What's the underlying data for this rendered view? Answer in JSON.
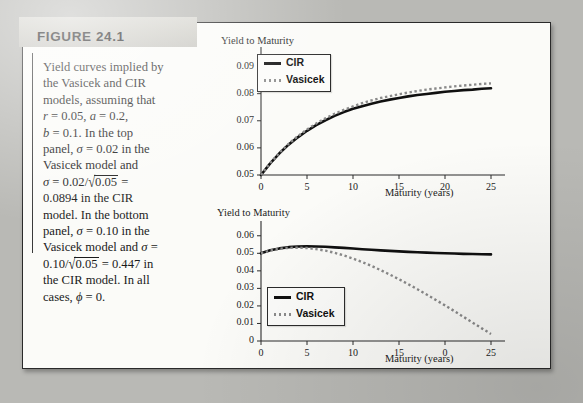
{
  "figure": {
    "label": "FIGURE 24.1",
    "caption_lines": [
      "Yield curves implied by",
      "the Vasicek and CIR",
      "models, assuming that",
      "r = 0.05, a = 0.2,",
      "b = 0.1. In the top",
      "panel, σ = 0.02 in the",
      "Vasicek model and",
      "σ = 0.02/√0.05 =",
      "0.0894 in the CIR",
      "model. In the bottom",
      "panel, σ = 0.10 in the",
      "Vasicek model and σ =",
      "0.10/√0.05 = 0.447 in",
      "the CIR model. In all",
      "cases, ϕ = 0."
    ],
    "parameters": {
      "r": "0.05",
      "a": "0.2",
      "b": "0.1",
      "phi": "0",
      "top_panel_sigma_vasicek": "0.02",
      "top_panel_sigma_cir": "0.0894",
      "bottom_panel_sigma_vasicek": "0.10",
      "bottom_panel_sigma_cir": "0.447"
    },
    "colors": {
      "cir_line": "#101010",
      "vasicek_line": "#8b8b8b",
      "header_band": "#d4d3cd",
      "paper": "#fbfbf8",
      "page_background": "#b9b9b5"
    }
  },
  "chart_data": [
    {
      "id": "top",
      "type": "line",
      "title": "",
      "ylabel": "Yield to Maturity",
      "xlabel": "Maturity (years)",
      "xlim": [
        0,
        25
      ],
      "ylim": [
        0.05,
        0.095
      ],
      "xticks": [
        0,
        5,
        10,
        15,
        20,
        25
      ],
      "xtick_labels": [
        "0",
        "5",
        "10",
        "15",
        "20",
        "25"
      ],
      "yticks": [
        0.05,
        0.06,
        0.07,
        0.08,
        0.09
      ],
      "ytick_labels": [
        "0.05",
        "0.06",
        "0.07",
        "0.08",
        "0.09"
      ],
      "grid": false,
      "legend_position": "upper left",
      "x": [
        0,
        1,
        2,
        3,
        4,
        5,
        6,
        7,
        8,
        9,
        10,
        11,
        12,
        13,
        14,
        15,
        16,
        17,
        18,
        19,
        20,
        21,
        22,
        23,
        24,
        25
      ],
      "series": [
        {
          "name": "CIR",
          "style": "solid",
          "values": [
            0.05,
            0.0543,
            0.058,
            0.0612,
            0.0639,
            0.0663,
            0.0684,
            0.0702,
            0.0718,
            0.0732,
            0.0744,
            0.0754,
            0.0763,
            0.0771,
            0.0778,
            0.0784,
            0.079,
            0.0795,
            0.0799,
            0.0803,
            0.0807,
            0.081,
            0.0813,
            0.0815,
            0.0818,
            0.082
          ]
        },
        {
          "name": "Vasicek",
          "style": "dotted",
          "values": [
            0.05,
            0.0544,
            0.0582,
            0.0615,
            0.0643,
            0.0668,
            0.069,
            0.0709,
            0.0726,
            0.074,
            0.0753,
            0.0765,
            0.0775,
            0.0784,
            0.0791,
            0.0798,
            0.0804,
            0.081,
            0.0815,
            0.0819,
            0.0823,
            0.0827,
            0.083,
            0.0833,
            0.0836,
            0.0838
          ]
        }
      ]
    },
    {
      "id": "bottom",
      "type": "line",
      "title": "",
      "ylabel": "Yield to Maturity",
      "xlabel": "Maturity (years)",
      "xlim": [
        0,
        25
      ],
      "ylim": [
        0,
        0.065
      ],
      "xticks": [
        0,
        5,
        10,
        15,
        20,
        25
      ],
      "xtick_labels": [
        "0",
        "5",
        "10",
        "15",
        "0",
        "25"
      ],
      "yticks": [
        0,
        0.01,
        0.02,
        0.03,
        0.04,
        0.05,
        0.06
      ],
      "ytick_labels": [
        "0",
        "0.01",
        "0.02",
        "0.03",
        "0.04",
        "0.05",
        "0.06"
      ],
      "grid": false,
      "legend_position": "lower left",
      "x": [
        0,
        1,
        2,
        3,
        4,
        5,
        6,
        7,
        8,
        9,
        10,
        11,
        12,
        13,
        14,
        15,
        16,
        17,
        18,
        19,
        20,
        21,
        22,
        23,
        24,
        25
      ],
      "series": [
        {
          "name": "CIR",
          "style": "solid",
          "values": [
            0.05,
            0.0517,
            0.0528,
            0.0535,
            0.0539,
            0.054,
            0.0539,
            0.0537,
            0.0534,
            0.0531,
            0.0527,
            0.0523,
            0.052,
            0.0517,
            0.0514,
            0.0511,
            0.0508,
            0.0506,
            0.0504,
            0.0502,
            0.05,
            0.0499,
            0.0497,
            0.0496,
            0.0495,
            0.0494
          ]
        },
        {
          "name": "Vasicek",
          "style": "dotted",
          "values": [
            0.05,
            0.0516,
            0.0526,
            0.0531,
            0.0532,
            0.053,
            0.0524,
            0.0515,
            0.0503,
            0.0488,
            0.047,
            0.045,
            0.0428,
            0.0404,
            0.0379,
            0.0352,
            0.0324,
            0.0295,
            0.0265,
            0.0234,
            0.0203,
            0.0171,
            0.0138,
            0.0105,
            0.0072,
            0.004
          ]
        }
      ]
    }
  ],
  "legend": {
    "cir_label": "CIR",
    "vasicek_label": "Vasicek"
  }
}
